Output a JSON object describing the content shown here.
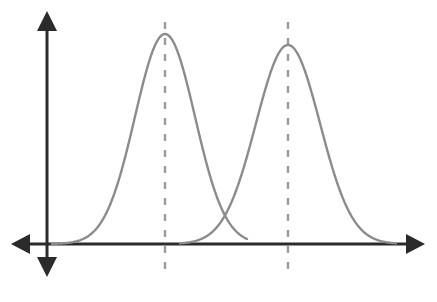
{
  "figure": {
    "title": "",
    "background_color": "#ffffff",
    "width": 437,
    "height": 302
  },
  "axes": {
    "name": "cartesian-axes",
    "color": "#2b2b2b",
    "line_width": 3,
    "arrowheads": [
      "up",
      "down",
      "left",
      "right"
    ],
    "origin": {
      "x": 47,
      "y": 244
    },
    "x_axis": {
      "start_x": 12,
      "end_x": 424,
      "y": 244,
      "label": "",
      "ticks": []
    },
    "y_axis": {
      "x": 47,
      "start_y": 12,
      "end_y": 276,
      "label": "",
      "ticks": []
    }
  },
  "chart_data": {
    "type": "line",
    "title": "",
    "subtitle": "",
    "xlabel": "",
    "ylabel": "",
    "grid": false,
    "legend": "none",
    "xlim": [
      0,
      437
    ],
    "ylim": [
      0,
      302
    ],
    "series": [
      {
        "name": "distribution-1",
        "curve_type": "bell",
        "color": "#8c8c8c",
        "line_width": 2,
        "mean_x": 165,
        "peak_y": 34,
        "baseline_y": 244,
        "sigma": 30,
        "start_x": 52,
        "end_x": 247,
        "mean_line": {
          "name": "mean-line-1",
          "x": 165,
          "top_y": 22,
          "bottom_y": 270,
          "style": "dashed",
          "color": "#9a9a9a",
          "line_width": 2,
          "dash_pattern": "7 9"
        }
      },
      {
        "name": "distribution-2",
        "curve_type": "bell",
        "color": "#8c8c8c",
        "line_width": 2,
        "mean_x": 288,
        "peak_y": 45,
        "baseline_y": 244,
        "sigma": 32,
        "start_x": 180,
        "end_x": 396,
        "mean_line": {
          "name": "mean-line-2",
          "x": 288,
          "top_y": 22,
          "bottom_y": 270,
          "style": "dashed",
          "color": "#9a9a9a",
          "line_width": 2,
          "dash_pattern": "7 9"
        }
      }
    ],
    "annotations": [
      {
        "name": "curve-intersection",
        "x": 222,
        "y": 226,
        "label": ""
      }
    ]
  }
}
